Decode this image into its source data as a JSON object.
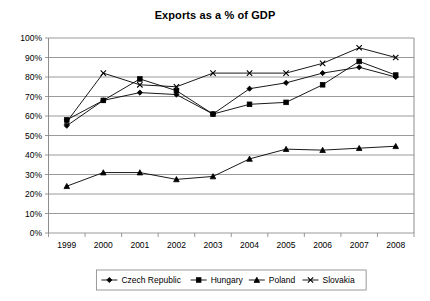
{
  "chart_data": {
    "type": "line",
    "title": "Exports as a % of GDP",
    "xlabel": "",
    "ylabel": "",
    "x": [
      "1999",
      "2000",
      "2001",
      "2002",
      "2003",
      "2004",
      "2005",
      "2006",
      "2007",
      "2008"
    ],
    "categories": [
      "1999",
      "2000",
      "2001",
      "2002",
      "2003",
      "2004",
      "2005",
      "2006",
      "2007",
      "2008"
    ],
    "ylim": [
      0,
      100
    ],
    "ytick_labels": [
      "0%",
      "10%",
      "20%",
      "30%",
      "40%",
      "50%",
      "60%",
      "70%",
      "80%",
      "90%",
      "100%"
    ],
    "ytick_values": [
      0,
      10,
      20,
      30,
      40,
      50,
      60,
      70,
      80,
      90,
      100
    ],
    "grid": true,
    "legend_position": "bottom",
    "series": [
      {
        "name": "Czech Republic",
        "marker": "diamond",
        "values": [
          55,
          68,
          72,
          71,
          61,
          74,
          77,
          82,
          85,
          80
        ]
      },
      {
        "name": "Hungary",
        "marker": "square",
        "values": [
          58,
          68,
          79,
          73,
          61,
          66,
          67,
          76,
          88,
          81
        ]
      },
      {
        "name": "Poland",
        "marker": "triangle",
        "values": [
          24,
          31,
          31,
          27.5,
          29,
          38,
          43,
          42.5,
          43.5,
          44.5
        ]
      },
      {
        "name": "Slovakia",
        "marker": "cross",
        "values": [
          57,
          82,
          76,
          75,
          82,
          82,
          82,
          87,
          95,
          90
        ]
      }
    ]
  },
  "legend": {
    "entries": [
      {
        "label": "Czech Republic",
        "marker": "diamond"
      },
      {
        "label": "Hungary",
        "marker": "square"
      },
      {
        "label": "Poland",
        "marker": "triangle"
      },
      {
        "label": "Slovakia",
        "marker": "cross"
      }
    ]
  },
  "colors": {
    "series": "#000000",
    "grid": "#808080",
    "background": "#ffffff",
    "text": "#000000"
  }
}
